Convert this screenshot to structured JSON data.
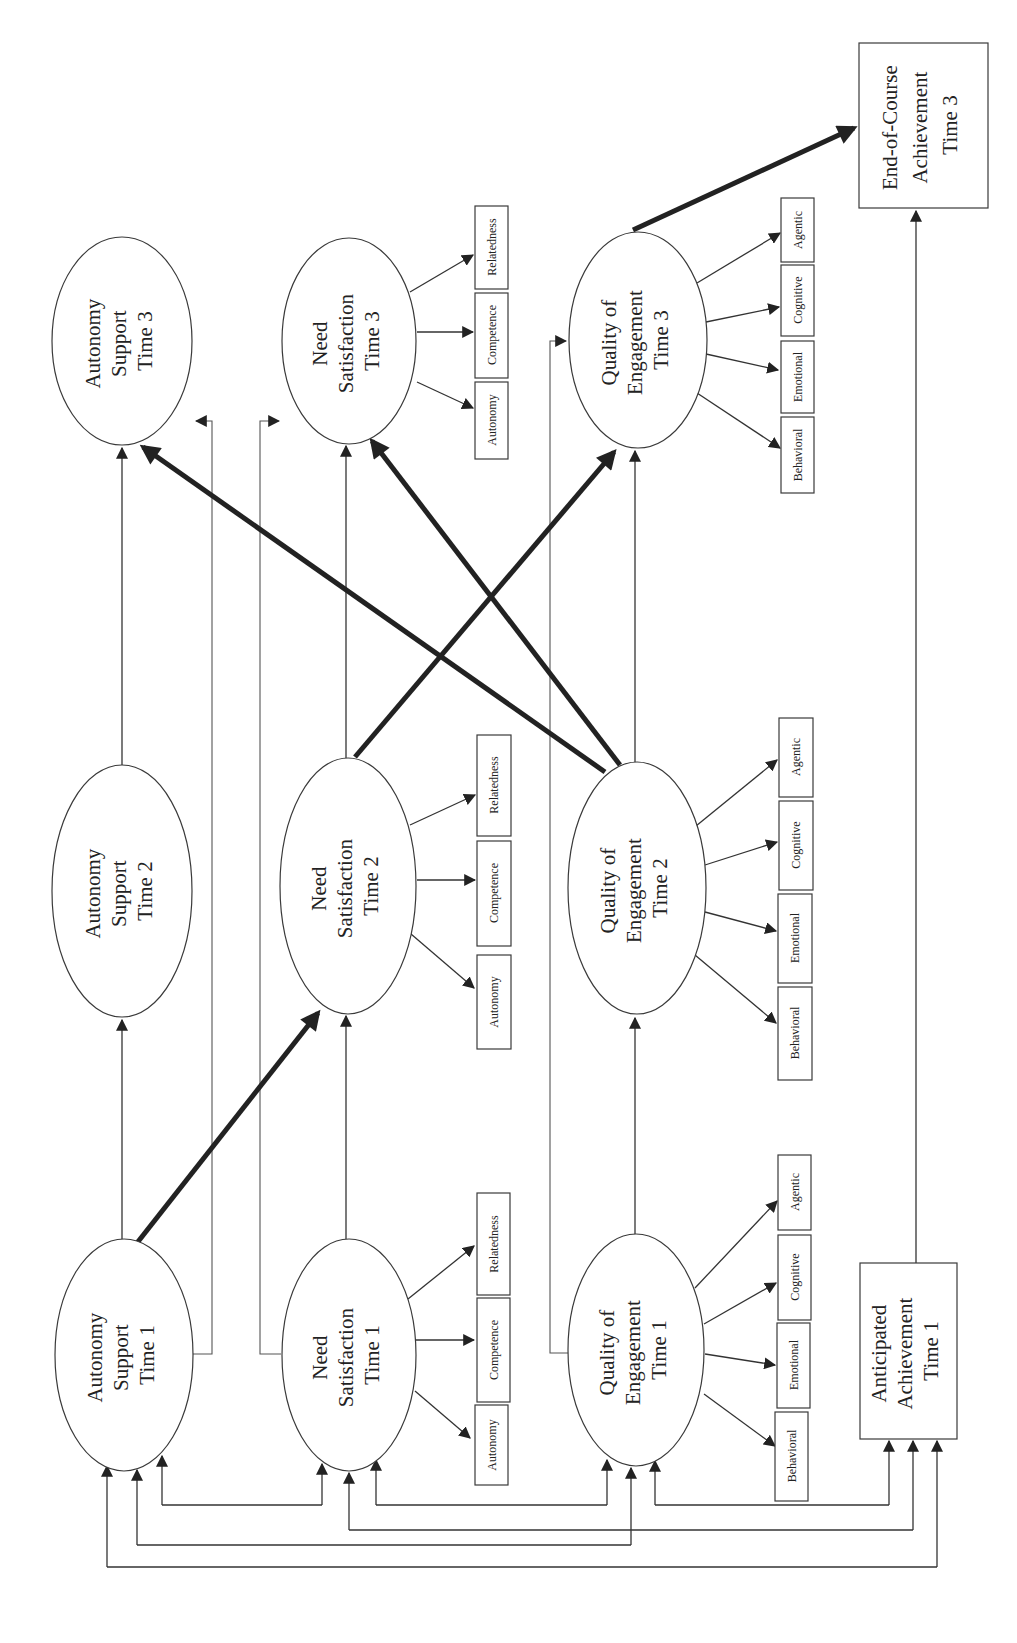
{
  "figure": {
    "orientation": "rotated 90 degrees counter-clockwise",
    "colors": {
      "line": "#333333",
      "thick_path": "#222222",
      "background": "#ffffff"
    }
  },
  "nodes": {
    "as1": {
      "lines": [
        "Autonomy",
        "Support",
        "Time 1"
      ]
    },
    "as2": {
      "lines": [
        "Autonomy",
        "Support",
        "Time 2"
      ]
    },
    "as3": {
      "lines": [
        "Autonomy",
        "Support",
        "Time 3"
      ]
    },
    "ns1": {
      "lines": [
        "Need",
        "Satisfaction",
        "Time 1"
      ]
    },
    "ns2": {
      "lines": [
        "Need",
        "Satisfaction",
        "Time 2"
      ]
    },
    "ns3": {
      "lines": [
        "Need",
        "Satisfaction",
        "Time 3"
      ]
    },
    "qe1": {
      "lines": [
        "Quality of",
        "Engagement",
        "Time 1"
      ]
    },
    "qe2": {
      "lines": [
        "Quality of",
        "Engagement",
        "Time 2"
      ]
    },
    "qe3": {
      "lines": [
        "Quality of",
        "Engagement",
        "Time 3"
      ]
    },
    "aa1": {
      "lines": [
        "Anticipated",
        "Achievement",
        "Time 1"
      ]
    },
    "ec3": {
      "lines": [
        "End-of-Course",
        "Achievement",
        "Time 3"
      ]
    }
  },
  "indicators": {
    "need_satisfaction": [
      "Autonomy",
      "Competence",
      "Relatedness"
    ],
    "engagement": [
      "Behavioral",
      "Emotional",
      "Cognitive",
      "Agentic"
    ]
  },
  "paths": {
    "thick": [
      {
        "from": "Autonomy Support Time 1",
        "to": "Need Satisfaction Time 2"
      },
      {
        "from": "Need Satisfaction Time 2",
        "to": "Quality of Engagement Time 3"
      },
      {
        "from": "Quality of Engagement Time 2",
        "to": "Autonomy Support Time 3"
      },
      {
        "from": "Quality of Engagement Time 2",
        "to": "Need Satisfaction Time 3"
      },
      {
        "from": "Quality of Engagement Time 3",
        "to": "End-of-Course Achievement Time 3"
      }
    ],
    "stability": [
      {
        "from": "Autonomy Support Time 1",
        "to": "Autonomy Support Time 2"
      },
      {
        "from": "Autonomy Support Time 2",
        "to": "Autonomy Support Time 3"
      },
      {
        "from": "Autonomy Support Time 1",
        "to": "Autonomy Support Time 3"
      },
      {
        "from": "Need Satisfaction Time 1",
        "to": "Need Satisfaction Time 2"
      },
      {
        "from": "Need Satisfaction Time 2",
        "to": "Need Satisfaction Time 3"
      },
      {
        "from": "Need Satisfaction Time 1",
        "to": "Need Satisfaction Time 3"
      },
      {
        "from": "Quality of Engagement Time 1",
        "to": "Quality of Engagement Time 2"
      },
      {
        "from": "Quality of Engagement Time 2",
        "to": "Quality of Engagement Time 3"
      },
      {
        "from": "Quality of Engagement Time 1",
        "to": "Quality of Engagement Time 3"
      },
      {
        "from": "Anticipated Achievement Time 1",
        "to": "End-of-Course Achievement Time 3"
      }
    ],
    "correlations_time1": [
      [
        "Autonomy Support Time 1",
        "Need Satisfaction Time 1"
      ],
      [
        "Need Satisfaction Time 1",
        "Quality of Engagement Time 1"
      ],
      [
        "Quality of Engagement Time 1",
        "Anticipated Achievement Time 1"
      ],
      [
        "Need Satisfaction Time 1",
        "Anticipated Achievement Time 1"
      ],
      [
        "Autonomy Support Time 1",
        "Quality of Engagement Time 1"
      ],
      [
        "Autonomy Support Time 1",
        "Anticipated Achievement Time 1"
      ]
    ]
  }
}
